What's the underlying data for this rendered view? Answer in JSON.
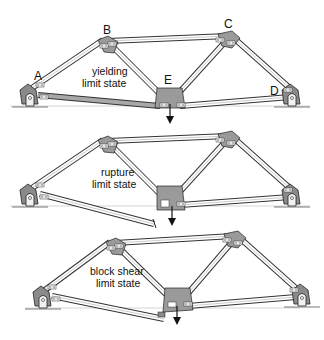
{
  "figure": {
    "node_labels": [
      "A",
      "B",
      "C",
      "D",
      "E"
    ],
    "panels": [
      {
        "id": "yielding",
        "label_line1": "yielding",
        "label_line2": "limit state",
        "failed_member": "AE",
        "failure_mode": "yielding (member elongated, shaded)"
      },
      {
        "id": "rupture",
        "label_line1": "rupture",
        "label_line2": "limit state",
        "failed_member": "AE",
        "failure_mode": "rupture (member fractured near E)"
      },
      {
        "id": "block-shear",
        "label_line1": "block shear",
        "label_line2": "limit state",
        "failed_member": "AE",
        "failure_mode": "block shear (connection torn out at E)"
      }
    ],
    "load": {
      "location": "E",
      "direction": "down"
    },
    "colors": {
      "member_fill": "#ffffff",
      "member_stroke": "#333333",
      "gusset": "#9a9a9a",
      "yield_shade": "#a8a8a8",
      "ground": "#555555"
    }
  }
}
